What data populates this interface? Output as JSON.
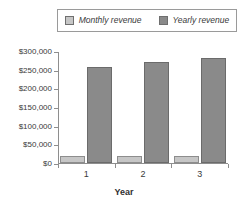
{
  "chart_data": {
    "type": "bar",
    "title": "",
    "subtitle": "",
    "xlabel": "Year",
    "ylabel": "",
    "categories": [
      "1",
      "2",
      "3"
    ],
    "series": [
      {
        "name": "Monthly revenue",
        "values": [
          20000,
          20000,
          20000
        ],
        "color": "#c6c6c6"
      },
      {
        "name": "Yearly revenue",
        "values": [
          258000,
          270000,
          280000
        ],
        "color": "#8a8a8a"
      }
    ],
    "ylim": [
      0,
      300000
    ],
    "yticks": [
      0,
      50000,
      100000,
      150000,
      200000,
      250000,
      300000
    ],
    "ytick_labels": [
      "$0",
      "$50,000",
      "$100,000",
      "$150,000",
      "$200,000",
      "$250,000",
      "$300,000"
    ],
    "xtick_labels": [
      "1",
      "2",
      "3"
    ],
    "grid": false,
    "legend_position": "top",
    "legend_italic": true
  },
  "legend": {
    "entries": [
      {
        "label": "Monthly revenue",
        "swatch": "legend-swatch-monthly"
      },
      {
        "label": "Yearly revenue",
        "swatch": "legend-swatch-yearly"
      }
    ]
  },
  "axes": {
    "x_title": "Year"
  },
  "colors": {
    "monthly": "#c6c6c6",
    "yearly": "#8a8a8a",
    "axis": "#8e8e8e",
    "text": "#3a3a3a",
    "background": "#ffffff"
  }
}
